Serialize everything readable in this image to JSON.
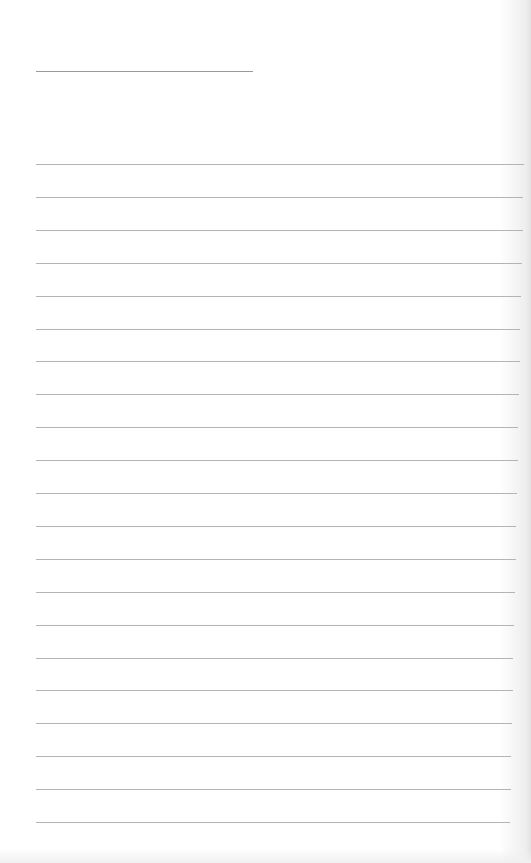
{
  "page": {
    "type": "blank lined notepad page",
    "title_line": {
      "text": ""
    },
    "ruled_lines": {
      "count": 21,
      "first_y": 164,
      "spacing": 32.9,
      "text": []
    },
    "colors": {
      "paper": "#ffffff",
      "rule": "#b4b4b4",
      "title_rule": "#9a9a9a"
    }
  }
}
